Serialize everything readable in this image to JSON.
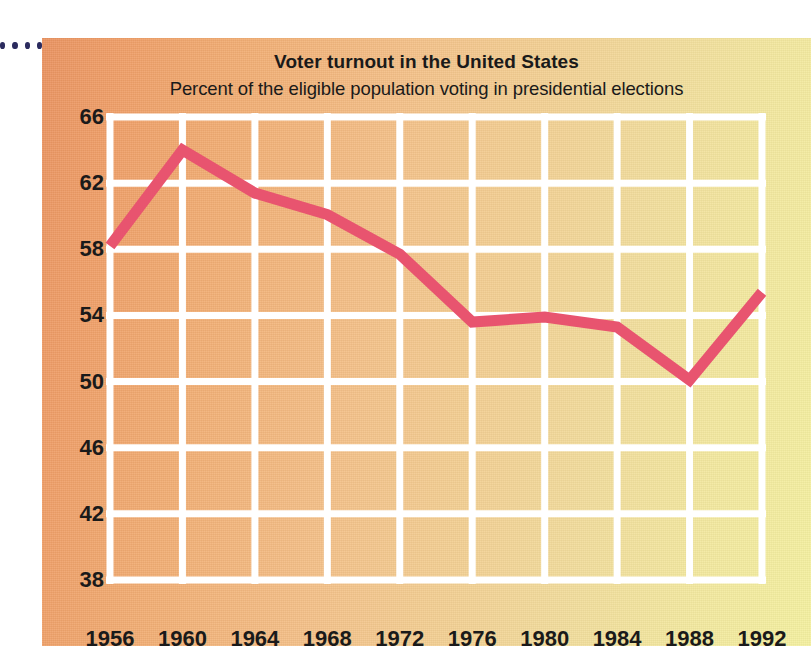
{
  "title": "Voter turnout in the United States",
  "subtitle": "Percent of the eligible population voting in presidential elections",
  "decor": {
    "dot_count": 4,
    "dot_color": "#2b2b5e"
  },
  "colors": {
    "line": "#e8546f",
    "grid": "#ffffff",
    "text": "#1a1a1a",
    "bg_left": "#ea9361",
    "bg_right": "#f4f0a0"
  },
  "chart_data": {
    "type": "line",
    "title": "Voter turnout in the United States",
    "subtitle": "Percent of the eligible population voting in presidential elections",
    "xlabel": "",
    "ylabel": "",
    "grid": true,
    "legend": "none",
    "xlim": [
      1956,
      1992
    ],
    "ylim": [
      38,
      66
    ],
    "xticks": [
      1956,
      1960,
      1964,
      1968,
      1972,
      1976,
      1980,
      1984,
      1988,
      1992
    ],
    "yticks": [
      38,
      42,
      46,
      50,
      54,
      58,
      62,
      66
    ],
    "x": [
      1956,
      1960,
      1964,
      1968,
      1972,
      1976,
      1980,
      1984,
      1988,
      1992
    ],
    "values": [
      58.2,
      64.0,
      61.4,
      60.1,
      57.7,
      53.6,
      53.9,
      53.3,
      50.1,
      55.4
    ],
    "series": [
      {
        "name": "Voter turnout",
        "values": [
          58.2,
          64.0,
          61.4,
          60.1,
          57.7,
          53.6,
          53.9,
          53.3,
          50.1,
          55.4
        ]
      }
    ],
    "points": [
      {
        "year": "1956",
        "value": 58.2
      },
      {
        "year": "1960",
        "value": 64.0
      },
      {
        "year": "1964",
        "value": 61.4
      },
      {
        "year": "1968",
        "value": 60.1
      },
      {
        "year": "1972",
        "value": 57.7
      },
      {
        "year": "1976",
        "value": 53.6
      },
      {
        "year": "1980",
        "value": 53.9
      },
      {
        "year": "1984",
        "value": 53.3
      },
      {
        "year": "1988",
        "value": 50.1
      },
      {
        "year": "1992",
        "value": 55.4
      }
    ]
  }
}
